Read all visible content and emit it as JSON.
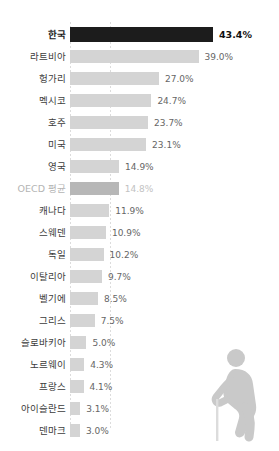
{
  "chart_data": {
    "type": "bar",
    "orientation": "horizontal",
    "title": "",
    "subtitle": "",
    "xlabel": "",
    "ylabel": "",
    "xlim": [
      0,
      45
    ],
    "grid": true,
    "gridlines_x": [
      0,
      10.8
    ],
    "legend": "none",
    "value_suffix": "%",
    "categories": [
      "한국",
      "라트비아",
      "헝가리",
      "멕시코",
      "호주",
      "미국",
      "영국",
      "OECD 평균",
      "캐나다",
      "스웨덴",
      "독일",
      "이탈리아",
      "벨기에",
      "그리스",
      "슬로바키아",
      "노르웨이",
      "프랑스",
      "아이슬란드",
      "덴마크"
    ],
    "values": [
      43.4,
      39.0,
      27.0,
      24.7,
      23.7,
      23.1,
      14.9,
      14.8,
      11.9,
      10.9,
      10.2,
      9.7,
      8.5,
      7.5,
      5.0,
      4.3,
      4.1,
      3.1,
      3.0
    ],
    "value_labels": [
      "43.4%",
      "39.0%",
      "27.0%",
      "24.7%",
      "23.7%",
      "23.1%",
      "14.9%",
      "14.8%",
      "11.9%",
      "10.9%",
      "10.2%",
      "9.7%",
      "8.5%",
      "7.5%",
      "5.0%",
      "4.3%",
      "4.1%",
      "3.1%",
      "3.0%"
    ],
    "highlight_category": "한국",
    "average_category": "OECD 평균",
    "colors": {
      "bar_default": "#d4d4d4",
      "bar_highlight": "#1c1c1c",
      "bar_average": "#b7b7b7",
      "label_default": "#3c3c3c",
      "label_highlight": "#1a1a1a",
      "label_average": "#b4b4b4",
      "value_default": "#666666",
      "value_highlight": "#111111",
      "value_average": "#c2c2c2",
      "gridline": "#dcdcdc",
      "background": "#ffffff",
      "figure": "#c9c9c9"
    }
  },
  "rows": [
    {
      "label": "한국",
      "value": 43.4,
      "value_label": "43.4%",
      "style": "highlight"
    },
    {
      "label": "라트비아",
      "value": 39.0,
      "value_label": "39.0%",
      "style": "normal"
    },
    {
      "label": "헝가리",
      "value": 27.0,
      "value_label": "27.0%",
      "style": "normal"
    },
    {
      "label": "멕시코",
      "value": 24.7,
      "value_label": "24.7%",
      "style": "normal"
    },
    {
      "label": "호주",
      "value": 23.7,
      "value_label": "23.7%",
      "style": "normal"
    },
    {
      "label": "미국",
      "value": 23.1,
      "value_label": "23.1%",
      "style": "normal"
    },
    {
      "label": "영국",
      "value": 14.9,
      "value_label": "14.9%",
      "style": "normal"
    },
    {
      "label": "OECD 평균",
      "value": 14.8,
      "value_label": "14.8%",
      "style": "average"
    },
    {
      "label": "캐나다",
      "value": 11.9,
      "value_label": "11.9%",
      "style": "normal"
    },
    {
      "label": "스웨덴",
      "value": 10.9,
      "value_label": "10.9%",
      "style": "normal"
    },
    {
      "label": "독일",
      "value": 10.2,
      "value_label": "10.2%",
      "style": "normal"
    },
    {
      "label": "이탈리아",
      "value": 9.7,
      "value_label": "9.7%",
      "style": "normal"
    },
    {
      "label": "벨기에",
      "value": 8.5,
      "value_label": "8.5%",
      "style": "normal"
    },
    {
      "label": "그리스",
      "value": 7.5,
      "value_label": "7.5%",
      "style": "normal"
    },
    {
      "label": "슬로바키아",
      "value": 5.0,
      "value_label": "5.0%",
      "style": "normal"
    },
    {
      "label": "노르웨이",
      "value": 4.3,
      "value_label": "4.3%",
      "style": "normal"
    },
    {
      "label": "프랑스",
      "value": 4.1,
      "value_label": "4.1%",
      "style": "normal"
    },
    {
      "label": "아이슬란드",
      "value": 3.1,
      "value_label": "3.1%",
      "style": "normal"
    },
    {
      "label": "덴마크",
      "value": 3.0,
      "value_label": "3.0%",
      "style": "normal"
    }
  ],
  "decoration": {
    "figure_name": "elderly-person-with-cane-icon"
  }
}
